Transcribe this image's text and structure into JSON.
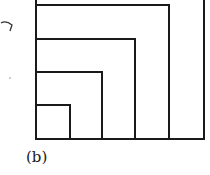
{
  "caption": "(b)",
  "diagram": {
    "stroke_color": "#1a1a1a",
    "stroke_width": 2,
    "origin": {
      "x": 36,
      "y": 139
    },
    "square_sizes": [
      33,
      66,
      99,
      133,
      168
    ]
  }
}
